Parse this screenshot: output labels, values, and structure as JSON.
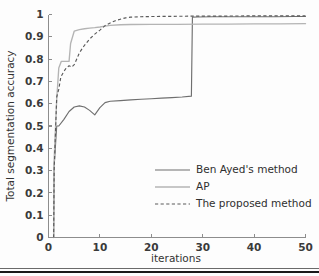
{
  "chart_data": {
    "type": "line",
    "title": "",
    "xlabel": "iterations",
    "ylabel": "Total segmentation accuracy",
    "xlim": [
      0,
      50
    ],
    "ylim": [
      0,
      1
    ],
    "xticks": [
      "0",
      "10",
      "20",
      "30",
      "40",
      "50"
    ],
    "xtick_values": [
      0,
      10,
      20,
      30,
      40,
      50
    ],
    "yticks": [
      "0",
      "0.1",
      "0.2",
      "0.3",
      "0.4",
      "0.5",
      "0.6",
      "0.7",
      "0.8",
      "0.9",
      "1"
    ],
    "ytick_values": [
      0,
      0.1,
      0.2,
      0.3,
      0.4,
      0.5,
      0.6,
      0.7,
      0.8,
      0.9,
      1
    ],
    "grid": false,
    "legend_position": "center-right",
    "series": [
      {
        "name": "Ben Ayed's method",
        "style": "solid",
        "color": "#6f6f6f",
        "x": [
          1,
          1.1,
          1.6,
          2,
          3,
          4,
          5,
          6,
          7,
          8,
          9,
          10,
          11,
          12,
          14,
          16,
          18,
          20,
          22,
          24,
          26,
          27.8,
          28,
          29,
          32,
          36,
          40,
          44,
          48,
          50
        ],
        "y": [
          0,
          0.32,
          0.5,
          0.5,
          0.53,
          0.565,
          0.585,
          0.59,
          0.585,
          0.57,
          0.55,
          0.582,
          0.605,
          0.611,
          0.614,
          0.617,
          0.62,
          0.622,
          0.625,
          0.627,
          0.63,
          0.634,
          0.988,
          0.989,
          0.99,
          0.99,
          0.99,
          0.99,
          0.991,
          0.991
        ]
      },
      {
        "name": "AP",
        "style": "solid",
        "color": "#b4b4b4",
        "x": [
          1,
          1.1,
          1.6,
          2,
          2.5,
          3,
          3.6,
          4,
          4.3,
          5,
          6,
          7,
          8,
          9,
          10,
          11,
          12,
          14,
          16,
          20,
          25,
          30,
          35,
          40,
          45,
          50
        ],
        "y": [
          0,
          0.35,
          0.62,
          0.76,
          0.79,
          0.79,
          0.79,
          0.79,
          0.87,
          0.925,
          0.932,
          0.936,
          0.939,
          0.941,
          0.944,
          0.948,
          0.951,
          0.954,
          0.955,
          0.956,
          0.956,
          0.957,
          0.957,
          0.958,
          0.958,
          0.959
        ]
      },
      {
        "name": "The proposed method",
        "style": "dashed",
        "color": "#5a5a5a",
        "x": [
          1,
          1.1,
          1.6,
          2,
          2.4,
          3,
          3.5,
          4,
          4.5,
          5,
          5.5,
          6,
          7,
          8,
          9,
          10,
          11,
          12,
          13,
          14,
          15,
          16,
          18,
          20,
          25,
          30,
          35,
          40,
          45,
          50
        ],
        "y": [
          0,
          0.3,
          0.63,
          0.665,
          0.72,
          0.745,
          0.762,
          0.77,
          0.764,
          0.775,
          0.8,
          0.828,
          0.862,
          0.89,
          0.912,
          0.93,
          0.95,
          0.962,
          0.972,
          0.979,
          0.985,
          0.988,
          0.99,
          0.991,
          0.992,
          0.993,
          0.993,
          0.994,
          0.994,
          0.994
        ]
      }
    ]
  },
  "legend": {
    "items": [
      {
        "label": "Ben Ayed's method"
      },
      {
        "label": "AP"
      },
      {
        "label": "The proposed method"
      }
    ]
  },
  "colors": {
    "ben": "#6f6f6f",
    "ap": "#b4b4b4",
    "proposed": "#5a5a5a",
    "axis": "#8d8d8d",
    "text": "#2f2f2f"
  }
}
